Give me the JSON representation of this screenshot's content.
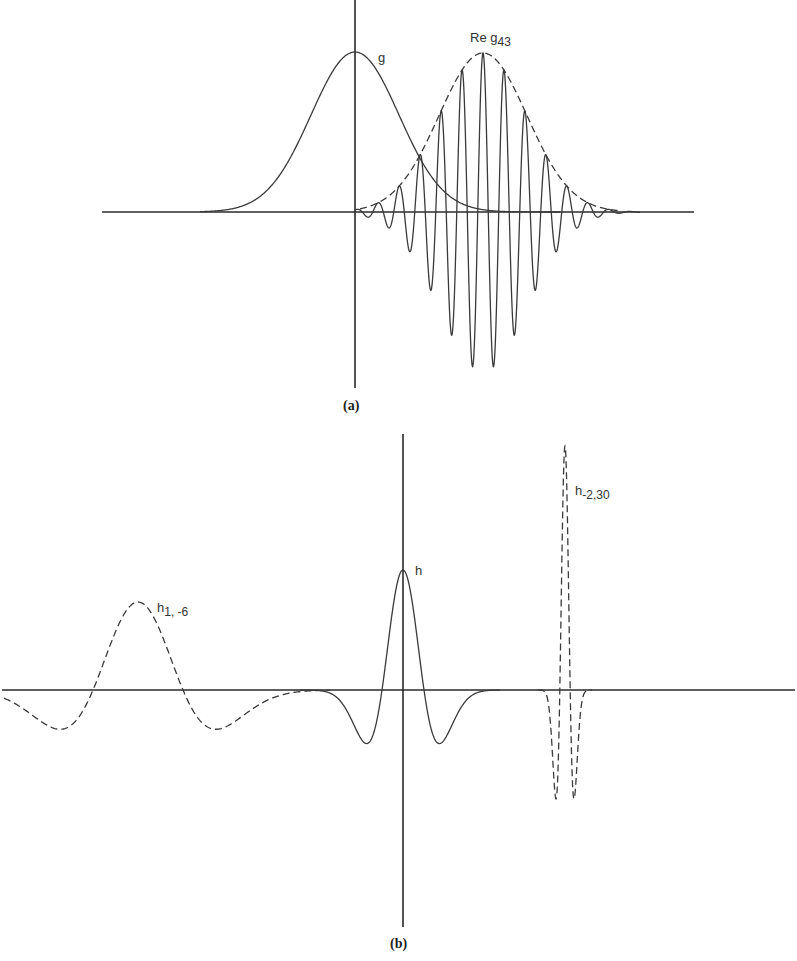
{
  "chart_data": [
    {
      "panel": "a",
      "type": "line",
      "caption": "(a)",
      "axes": {
        "x_axis": {
          "x1": 102,
          "x2": 694,
          "y": 212
        },
        "y_axis": {
          "x": 355,
          "y1": 0,
          "y2": 388
        }
      },
      "series": [
        {
          "name": "g",
          "label": "g",
          "style": "solid",
          "kind": "gaussian",
          "center_px": 355,
          "amplitude_px": 160,
          "sigma_px": 44
        },
        {
          "name": "Re g_43",
          "label_main": "Re g",
          "label_sub": "43",
          "style": "solid",
          "kind": "modulated_gaussian",
          "center_px": 483,
          "amplitude_px": 159,
          "sigma_px": 44,
          "period_px": 21
        },
        {
          "name": "envelope",
          "style": "dashed",
          "kind": "gaussian",
          "center_px": 483,
          "amplitude_px": 159,
          "sigma_px": 44
        }
      ],
      "annotations": [
        {
          "text": "g",
          "x": 381,
          "y": 52
        },
        {
          "text": "Re g43",
          "x": 471,
          "y": 32
        }
      ]
    },
    {
      "panel": "b",
      "type": "line",
      "caption": "(b)",
      "axes": {
        "x_axis": {
          "x1": 2,
          "x2": 795,
          "y": 690
        },
        "y_axis": {
          "x": 403,
          "y1": 434,
          "y2": 927
        }
      },
      "series": [
        {
          "name": "h",
          "label": "h",
          "style": "solid",
          "kind": "mexican_hat",
          "center_px": 403,
          "amplitude_px": 120,
          "scale_px": 21
        },
        {
          "name": "h_{1,-6}",
          "label_main": "h",
          "label_sub": "1, -6",
          "style": "dashed",
          "kind": "mexican_hat",
          "center_px": 138,
          "amplitude_px": 88,
          "scale_px": 45
        },
        {
          "name": "h_{-2,30}",
          "label_main": "h",
          "label_sub": "-2,30",
          "style": "dashed",
          "kind": "mexican_hat",
          "center_px": 565,
          "amplitude_px": 244,
          "scale_px": 5.2
        }
      ],
      "annotations": [
        {
          "text": "h",
          "x": 416,
          "y": 566
        },
        {
          "text": "h1,-6",
          "x": 160,
          "y": 601
        },
        {
          "text": "h-2,30",
          "x": 576,
          "y": 486
        }
      ]
    }
  ],
  "labels": {
    "g": "g",
    "re_g43_main": "Re g",
    "re_g43_sub": "43",
    "h": "h",
    "h1_main": "h",
    "h1_sub": "1, -6",
    "h2_main": "h",
    "h2_sub": "-2,30",
    "cap_a": "(a)",
    "cap_b": "(b)"
  }
}
